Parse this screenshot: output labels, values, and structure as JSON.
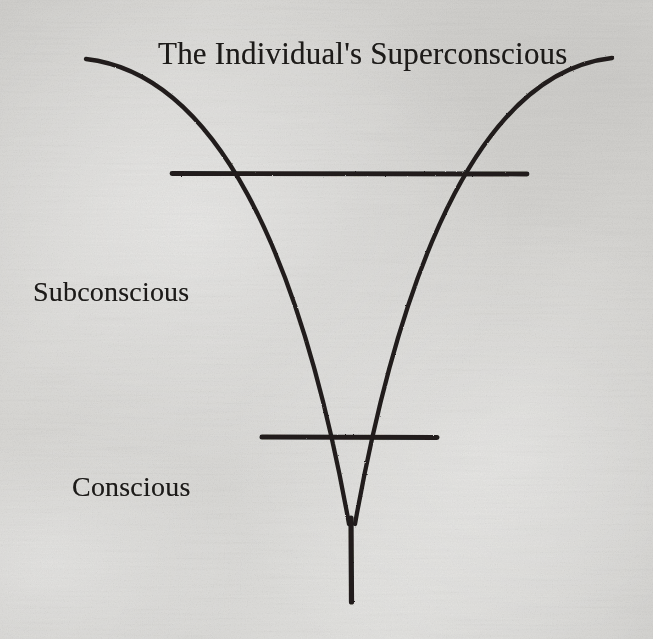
{
  "figure": {
    "kind": "diagram",
    "title": "The Individual's Superconscious",
    "medium": "scanned book page",
    "background_color": "#d9d8d5",
    "ink_color": "#1e1c1a",
    "canvas": {
      "width": 653,
      "height": 639
    },
    "labels": [
      {
        "id": "title",
        "text": "The Individual's Superconscious",
        "x": 158,
        "y": 36,
        "size": 31
      },
      {
        "id": "subconscious",
        "text": "Subconscious",
        "x": 33,
        "y": 276,
        "size": 28
      },
      {
        "id": "conscious",
        "text": "Conscious",
        "x": 72,
        "y": 471,
        "size": 28
      }
    ],
    "strokes": {
      "curve_width": 4.2,
      "rule_width": 5.0,
      "tail_width": 5.2
    },
    "geometry": {
      "left_curve": {
        "start": [
          86,
          59
        ],
        "control_1": [
          215,
          74
        ],
        "control_2": [
          300,
          250
        ],
        "end": [
          349,
          524
        ]
      },
      "right_curve": {
        "start": [
          612,
          58
        ],
        "control_1": [
          486,
          72
        ],
        "control_2": [
          404,
          250
        ],
        "end": [
          355,
          524
        ]
      },
      "upper_rule": {
        "x1": 172,
        "y1": 173,
        "x2": 527,
        "y2": 174
      },
      "lower_rule": {
        "x1": 262,
        "y1": 437,
        "x2": 437,
        "y2": 437
      },
      "tail": {
        "x1": 351,
        "y1": 520,
        "x2": 351,
        "y2": 602
      },
      "upper_rule_crossings": [
        [
          247,
          174
        ],
        [
          452,
          174
        ]
      ],
      "lower_rule_crossings": [
        [
          341,
          437
        ],
        [
          362,
          437
        ]
      ]
    }
  }
}
